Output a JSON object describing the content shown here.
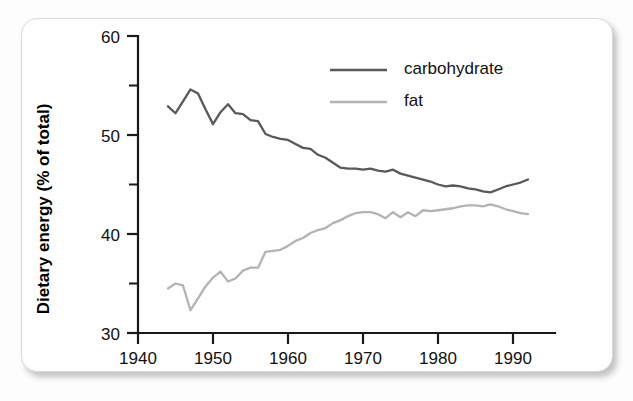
{
  "figure": {
    "background_color": "#fefefe",
    "border_color": "#d9d9d9"
  },
  "chart_data": {
    "type": "line",
    "title": "",
    "xlabel": "",
    "ylabel": "Dietary energy (% of total)",
    "xlim": [
      1940,
      1995
    ],
    "ylim": [
      30,
      60
    ],
    "x_ticks": [
      1940,
      1950,
      1960,
      1970,
      1980,
      1990
    ],
    "x_tick_labels": [
      "1940",
      "1950",
      "1960",
      "1970",
      "1980",
      "1990"
    ],
    "y_ticks": [
      30,
      40,
      50,
      60
    ],
    "y_tick_labels": [
      "30",
      "40",
      "50",
      "60"
    ],
    "y_minor_ticks": [
      35,
      45,
      55
    ],
    "grid": false,
    "legend_position": "upper right",
    "legend": [
      "carbohydrate",
      "fat"
    ],
    "x": [
      1944,
      1945,
      1946,
      1947,
      1948,
      1949,
      1950,
      1951,
      1952,
      1953,
      1954,
      1955,
      1956,
      1957,
      1958,
      1959,
      1960,
      1961,
      1962,
      1963,
      1964,
      1965,
      1966,
      1967,
      1968,
      1969,
      1970,
      1971,
      1972,
      1973,
      1974,
      1975,
      1976,
      1977,
      1978,
      1979,
      1980,
      1981,
      1982,
      1983,
      1984,
      1985,
      1986,
      1987,
      1988,
      1989,
      1990,
      1991,
      1992
    ],
    "series": [
      {
        "name": "carbohydrate",
        "color": "#595959",
        "values": [
          52.9,
          52.2,
          53.4,
          54.6,
          54.2,
          52.6,
          51.1,
          52.3,
          53.1,
          52.2,
          52.1,
          51.5,
          51.4,
          50.1,
          49.8,
          49.6,
          49.5,
          49.1,
          48.7,
          48.6,
          48.0,
          47.7,
          47.2,
          46.7,
          46.6,
          46.6,
          46.5,
          46.6,
          46.4,
          46.3,
          46.5,
          46.1,
          45.9,
          45.7,
          45.5,
          45.3,
          45.0,
          44.8,
          44.9,
          44.8,
          44.6,
          44.5,
          44.3,
          44.2,
          44.5,
          44.8,
          45.0,
          45.2,
          45.5
        ]
      },
      {
        "name": "fat",
        "color": "#b3b3b3",
        "values": [
          34.5,
          35.0,
          34.8,
          32.3,
          33.5,
          34.7,
          35.6,
          36.2,
          35.2,
          35.5,
          36.3,
          36.6,
          36.6,
          38.2,
          38.3,
          38.4,
          38.8,
          39.3,
          39.6,
          40.1,
          40.4,
          40.6,
          41.1,
          41.4,
          41.8,
          42.1,
          42.2,
          42.2,
          42.0,
          41.6,
          42.2,
          41.7,
          42.2,
          41.8,
          42.4,
          42.3,
          42.4,
          42.5,
          42.6,
          42.8,
          42.9,
          42.9,
          42.8,
          43.0,
          42.8,
          42.5,
          42.3,
          42.1,
          42.0
        ]
      }
    ]
  }
}
